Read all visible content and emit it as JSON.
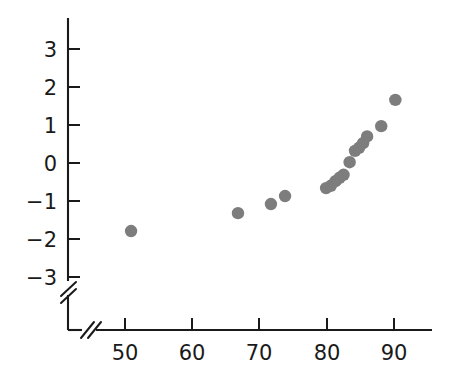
{
  "figure": {
    "title": "",
    "background_color": "#ffffff",
    "width": 452,
    "height": 370
  },
  "axes": {
    "x": {
      "label": "",
      "tick_labels": [
        "50",
        "60",
        "70",
        "80",
        "90"
      ],
      "tick_values": [
        50,
        60,
        70,
        80,
        90
      ],
      "axis_break": true,
      "break_symbol": "//",
      "line_color": "#1a1a1a"
    },
    "y": {
      "label": "",
      "tick_labels": [
        "3",
        "2",
        "1",
        "0",
        "−1",
        "−2",
        "−3"
      ],
      "tick_values": [
        3,
        2,
        1,
        0,
        -1,
        -2,
        -3
      ],
      "axis_break": true,
      "break_symbol": "//",
      "line_color": "#1a1a1a"
    }
  },
  "marker": {
    "color": "#7d7d7d",
    "shape": "circle",
    "radius_px": 6.2
  },
  "chart_data": {
    "type": "scatter",
    "title": "",
    "xlabel": "",
    "ylabel": "",
    "xlim": [
      44,
      95
    ],
    "ylim": [
      -3.6,
      3.5
    ],
    "grid": false,
    "legend": null,
    "series": [
      {
        "name": "observations",
        "color": "#7d7d7d",
        "points": [
          {
            "x": 50.9,
            "y": -1.79
          },
          {
            "x": 66.8,
            "y": -1.32
          },
          {
            "x": 71.7,
            "y": -1.08
          },
          {
            "x": 73.8,
            "y": -0.87
          },
          {
            "x": 79.9,
            "y": -0.66
          },
          {
            "x": 80.6,
            "y": -0.6
          },
          {
            "x": 81.3,
            "y": -0.48
          },
          {
            "x": 81.9,
            "y": -0.39
          },
          {
            "x": 82.5,
            "y": -0.31
          },
          {
            "x": 83.4,
            "y": 0.02
          },
          {
            "x": 84.2,
            "y": 0.32
          },
          {
            "x": 84.8,
            "y": 0.4
          },
          {
            "x": 85.4,
            "y": 0.52
          },
          {
            "x": 86.0,
            "y": 0.7
          },
          {
            "x": 88.1,
            "y": 0.97
          },
          {
            "x": 90.2,
            "y": 1.66
          }
        ]
      }
    ]
  }
}
